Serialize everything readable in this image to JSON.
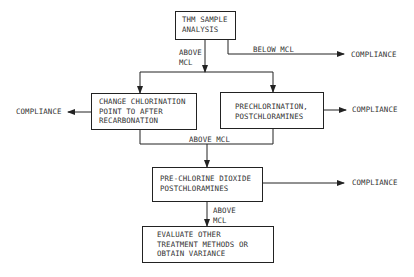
{
  "nodes": {
    "thm": {
      "lines": [
        "THM SAMPLE",
        "ANALYSIS"
      ]
    },
    "change": {
      "lines": [
        "CHANGE CHLORINATION",
        "POINT TO AFTER",
        "RECARBONATION"
      ]
    },
    "prechlor": {
      "lines": [
        "PRECHLORINATION,",
        "POSTCHLORAMINES"
      ]
    },
    "dioxide": {
      "lines": [
        "PRE-CHLORINE DIOXIDE",
        "POSTCHLORAMINES"
      ]
    },
    "evaluate": {
      "lines": [
        "EVALUATE OTHER",
        "TREATMENT METHODS OR",
        "OBTAIN VARIANCE"
      ]
    }
  },
  "edge_labels": {
    "above_mcl_1": [
      "ABOVE",
      "MCL"
    ],
    "below_mcl": "BELOW MCL",
    "above_mcl_2": "ABOVE MCL",
    "above_mcl_3": [
      "ABOVE",
      "MCL"
    ]
  },
  "outcomes": {
    "compliance_1": "COMPLIANCE",
    "compliance_2": "COMPLIANCE",
    "compliance_3": "COMPLIANCE",
    "compliance_4": "COMPLIANCE"
  }
}
